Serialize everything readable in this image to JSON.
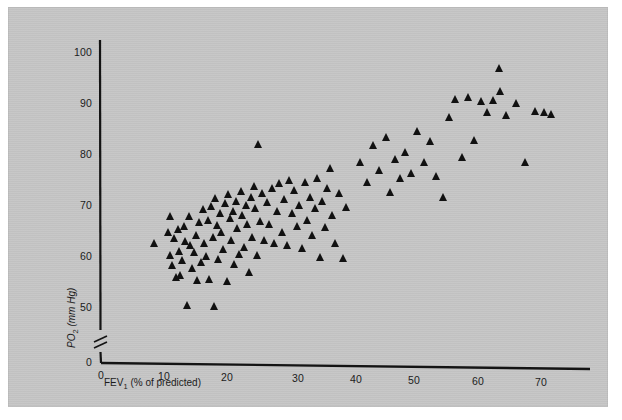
{
  "figure": {
    "background_color": "#ffffff",
    "plate_color": "#c6c6c6",
    "marker_color": "#111111",
    "axis_color": "#141414"
  },
  "chart_data": {
    "type": "scatter",
    "title": "",
    "subtitle": "",
    "xlabel": "FEV1 (% of predicted)",
    "xlabel_base": "FEV",
    "xlabel_sub": "1",
    "xlabel_rest": " (% of predicted)",
    "ylabel": "PO2 (mm Hg)",
    "ylabel_base": "PO",
    "ylabel_sub": "2",
    "ylabel_rest": " (mm Hg)",
    "xlim": [
      0,
      75
    ],
    "ylim": [
      50,
      103
    ],
    "y_axis_break": true,
    "y_origin_label": "0",
    "x_origin_label": "0",
    "grid": false,
    "legend": null,
    "xticks": [
      0,
      10,
      20,
      30,
      40,
      50,
      60,
      70
    ],
    "xtick_labels": [
      "0",
      "10",
      "20",
      "30",
      "40",
      "50",
      "60",
      "70"
    ],
    "yticks": [
      50,
      60,
      70,
      80,
      90,
      100
    ],
    "ytick_labels": [
      "50",
      "60",
      "70",
      "80",
      "90",
      "100"
    ],
    "marker": "triangle",
    "series": [
      {
        "name": "patients",
        "n": 122,
        "points": [
          [
            8.5,
            62.5
          ],
          [
            10.6,
            64.7
          ],
          [
            10.9,
            60.2
          ],
          [
            11.0,
            67.8
          ],
          [
            11.3,
            58.3
          ],
          [
            11.6,
            63.6
          ],
          [
            11.9,
            55.9
          ],
          [
            12.2,
            65.3
          ],
          [
            12.4,
            61.0
          ],
          [
            12.6,
            56.2
          ],
          [
            12.9,
            59.3
          ],
          [
            13.2,
            66.0
          ],
          [
            13.4,
            63.0
          ],
          [
            13.7,
            50.4
          ],
          [
            14.0,
            68.0
          ],
          [
            14.2,
            62.2
          ],
          [
            14.5,
            57.6
          ],
          [
            14.8,
            60.8
          ],
          [
            15.1,
            64.2
          ],
          [
            15.3,
            55.4
          ],
          [
            15.6,
            66.8
          ],
          [
            15.9,
            58.9
          ],
          [
            16.2,
            69.4
          ],
          [
            16.4,
            62.6
          ],
          [
            16.7,
            60.0
          ],
          [
            17.0,
            67.2
          ],
          [
            17.2,
            55.6
          ],
          [
            17.5,
            70.0
          ],
          [
            17.7,
            63.8
          ],
          [
            17.9,
            50.2
          ],
          [
            18.1,
            71.6
          ],
          [
            18.4,
            66.2
          ],
          [
            18.6,
            59.6
          ],
          [
            18.9,
            68.6
          ],
          [
            19.1,
            64.8
          ],
          [
            19.4,
            61.4
          ],
          [
            19.6,
            70.6
          ],
          [
            19.9,
            55.2
          ],
          [
            20.1,
            72.4
          ],
          [
            20.4,
            67.6
          ],
          [
            20.6,
            63.2
          ],
          [
            20.9,
            69.0
          ],
          [
            21.1,
            58.6
          ],
          [
            21.4,
            71.0
          ],
          [
            21.6,
            65.6
          ],
          [
            21.9,
            60.6
          ],
          [
            22.2,
            73.0
          ],
          [
            22.4,
            68.2
          ],
          [
            22.7,
            62.0
          ],
          [
            22.9,
            70.2
          ],
          [
            23.2,
            66.4
          ],
          [
            23.4,
            57.0
          ],
          [
            23.7,
            71.8
          ],
          [
            23.9,
            64.0
          ],
          [
            24.2,
            74.0
          ],
          [
            24.4,
            69.6
          ],
          [
            24.7,
            60.4
          ],
          [
            24.9,
            82.2
          ],
          [
            25.2,
            67.0
          ],
          [
            25.5,
            72.6
          ],
          [
            25.8,
            63.4
          ],
          [
            26.2,
            70.8
          ],
          [
            26.6,
            66.6
          ],
          [
            27.0,
            73.6
          ],
          [
            27.4,
            62.8
          ],
          [
            27.8,
            69.2
          ],
          [
            28.2,
            74.6
          ],
          [
            28.6,
            65.0
          ],
          [
            29.0,
            71.4
          ],
          [
            29.4,
            62.4
          ],
          [
            29.8,
            75.2
          ],
          [
            30.2,
            68.8
          ],
          [
            30.6,
            73.2
          ],
          [
            31.0,
            66.2
          ],
          [
            31.4,
            70.4
          ],
          [
            31.8,
            61.8
          ],
          [
            32.2,
            74.8
          ],
          [
            32.6,
            67.4
          ],
          [
            33.0,
            72.0
          ],
          [
            33.4,
            64.4
          ],
          [
            33.8,
            69.8
          ],
          [
            34.2,
            75.6
          ],
          [
            34.6,
            60.2
          ],
          [
            35.0,
            71.2
          ],
          [
            35.4,
            66.0
          ],
          [
            35.8,
            73.8
          ],
          [
            36.2,
            77.6
          ],
          [
            36.6,
            68.4
          ],
          [
            37.0,
            63.0
          ],
          [
            37.6,
            72.8
          ],
          [
            38.2,
            60.0
          ],
          [
            38.8,
            70.0
          ],
          [
            41.0,
            79.0
          ],
          [
            42.0,
            75.0
          ],
          [
            43.0,
            82.4
          ],
          [
            44.0,
            77.4
          ],
          [
            45.0,
            84.0
          ],
          [
            45.6,
            73.2
          ],
          [
            46.4,
            79.6
          ],
          [
            47.2,
            75.8
          ],
          [
            48.0,
            81.0
          ],
          [
            49.0,
            77.0
          ],
          [
            50.0,
            85.2
          ],
          [
            51.0,
            79.2
          ],
          [
            52.0,
            83.2
          ],
          [
            53.0,
            76.4
          ],
          [
            54.0,
            72.2
          ],
          [
            55.0,
            88.0
          ],
          [
            56.0,
            91.6
          ],
          [
            57.0,
            80.2
          ],
          [
            58.0,
            92.0
          ],
          [
            59.0,
            83.6
          ],
          [
            60.0,
            91.2
          ],
          [
            61.0,
            89.0
          ],
          [
            62.0,
            91.4
          ],
          [
            62.8,
            97.8
          ],
          [
            63.0,
            93.2
          ],
          [
            64.0,
            88.6
          ],
          [
            65.5,
            91.0
          ],
          [
            67.0,
            79.4
          ],
          [
            68.5,
            89.4
          ],
          [
            70.0,
            89.2
          ],
          [
            71.0,
            88.8
          ]
        ]
      }
    ]
  }
}
